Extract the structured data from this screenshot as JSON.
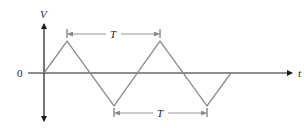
{
  "diagram": {
    "axes": {
      "y_label": "V",
      "x_label": "t",
      "origin_label": "0"
    },
    "waveform": {
      "type": "triangle",
      "color": "#8a8a8a",
      "points": [
        [
          44,
          73
        ],
        [
          67,
          41
        ],
        [
          114,
          106
        ],
        [
          160,
          41
        ],
        [
          207,
          106
        ],
        [
          231,
          73
        ]
      ]
    },
    "period_annotations": [
      {
        "label": "T",
        "from_x": 67,
        "to_x": 160,
        "y": 34,
        "position": "above"
      },
      {
        "label": "T",
        "from_x": 114,
        "to_x": 207,
        "y": 113,
        "position": "below"
      }
    ],
    "colors": {
      "axis": "#1a1a1a",
      "wave": "#8a8a8a",
      "annotation": "#8a8a8a",
      "text": "#222222"
    }
  }
}
